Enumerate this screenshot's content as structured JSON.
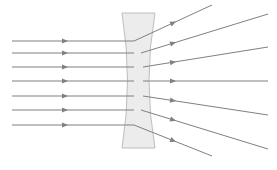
{
  "figure": {
    "type": "optics-ray-diagram",
    "width": 277,
    "height": 170,
    "background_color": "#ffffff"
  },
  "style": {
    "ray_color": "#808080",
    "ray_width": 1.0,
    "lens_fill": "#ececec",
    "lens_stroke": "#bdbdbd",
    "lens_stroke_width": 1.0,
    "arrow_color": "#808080"
  },
  "lens": {
    "name": "biconcave-diverging-lens",
    "label": "Concave (diverging) lens",
    "top_y": 13,
    "bottom_y": 148,
    "top_left_x": 122,
    "top_right_x": 155,
    "bottom_left_x": 122,
    "bottom_right_x": 155,
    "waist_left_x": 133,
    "waist_right_x": 143,
    "center_y": 81,
    "axis_y": 81
  },
  "incoming_rays": {
    "label": "Incident parallel rays",
    "start_x": 12,
    "end_x": 134,
    "arrow_x": 68,
    "count": 7,
    "y_positions": [
      41,
      53,
      67,
      81,
      96,
      110,
      125
    ]
  },
  "outgoing_rays": {
    "label": "Refracted diverging rays",
    "arrow_x": 176,
    "count": 7,
    "segments": [
      {
        "x1": 134,
        "y1": 41,
        "x2": 212,
        "y2": 5
      },
      {
        "x1": 141,
        "y1": 53,
        "x2": 268,
        "y2": 14
      },
      {
        "x1": 143,
        "y1": 67,
        "x2": 268,
        "y2": 47
      },
      {
        "x1": 143,
        "y1": 81,
        "x2": 268,
        "y2": 81
      },
      {
        "x1": 143,
        "y1": 96,
        "x2": 268,
        "y2": 115
      },
      {
        "x1": 141,
        "y1": 110,
        "x2": 268,
        "y2": 149
      },
      {
        "x1": 134,
        "y1": 125,
        "x2": 212,
        "y2": 156
      }
    ]
  }
}
